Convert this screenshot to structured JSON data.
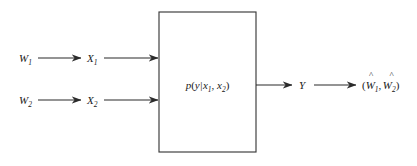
{
  "diagram": {
    "colors": {
      "background": "#ffffff",
      "stroke": "#2b2b2b",
      "box_stroke": "#3a3a3a",
      "text": "#1a1a1a"
    },
    "channel_box": {
      "label_base": "p",
      "label_full": "p(y|x1, x2)",
      "open_paren": "(",
      "output_var": "y",
      "given_bar": "|",
      "input_var_1": "x",
      "input_sub_1": "1",
      "comma": ", ",
      "input_var_2": "x",
      "input_sub_2": "2",
      "close_paren": ")"
    },
    "inputs": [
      {
        "message_symbol": "W",
        "message_sub": "1",
        "codeword_symbol": "X",
        "codeword_sub": "1"
      },
      {
        "message_symbol": "W",
        "message_sub": "2",
        "codeword_symbol": "X",
        "codeword_sub": "2"
      }
    ],
    "output": {
      "channel_output_symbol": "Y",
      "decoded_open": "(",
      "decoded_symbol_1": "W",
      "decoded_sub_1": "1",
      "decoded_hat_1": "^",
      "decoded_comma": ",",
      "decoded_symbol_2": "W",
      "decoded_sub_2": "2",
      "decoded_hat_2": "^",
      "decoded_close": ")"
    }
  }
}
